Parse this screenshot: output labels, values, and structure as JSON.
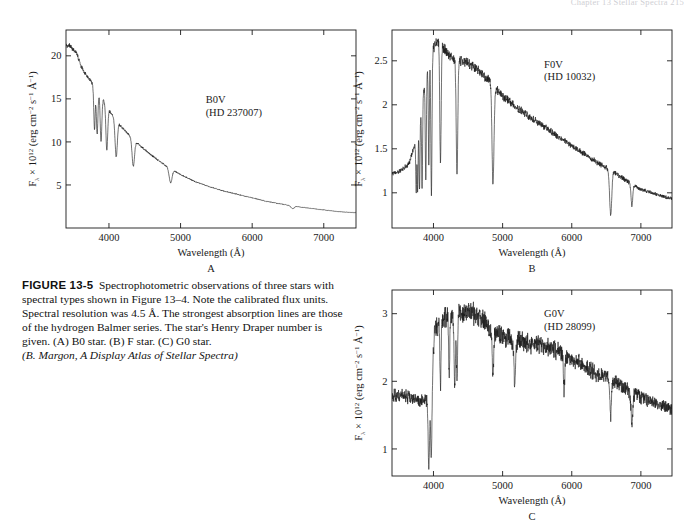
{
  "page": {
    "running_head": "Chapter 13  Stellar Spectra    215",
    "background": "#ffffff",
    "ink": "#1a1a1a"
  },
  "caption": {
    "figure_label": "FIGURE 13-5",
    "body": "Spectrophotometric observations of three stars with spectral types shown in Figure 13–4. Note the calibrated flux units. Spectral resolution was 4.5 Å. The strongest absorption lines are those of the hydrogen Balmer series. The star's Henry Draper number is given. (A) B0 star. (B) F star. (C) G0 star.",
    "credit": "(B. Margon, A Display Atlas of Stellar Spectra)"
  },
  "axis": {
    "xlabel": "Wavelength (Å)",
    "ylabel_prefix": "F",
    "ylabel_sub": "λ",
    "ylabel_mid": " × 10",
    "ylabel_exp": "12",
    "ylabel_units": " (erg cm",
    "ylabel_exp2": "−2",
    "ylabel_units2": " s",
    "ylabel_exp3": "−1",
    "ylabel_units3": " Å",
    "ylabel_exp4": "−1",
    "ylabel_close": ")"
  },
  "chart_data": [
    {
      "type": "line",
      "panel": "A",
      "panel_letter": "A",
      "title": "B0V",
      "subtitle": "(HD 237007)",
      "spectral_type": "B0V",
      "hd_number": "HD 237007",
      "xlabel": "Wavelength (Å)",
      "ylabel": "F_lambda x 10^12 (erg cm^-2 s^-1 A^-1)",
      "xlim": [
        3400,
        7450
      ],
      "ylim": [
        0,
        23
      ],
      "xticks": [
        4000,
        5000,
        6000,
        7000
      ],
      "yticks": [
        5,
        10,
        15,
        20
      ],
      "grid": false,
      "legend": "none",
      "annotation_xy": [
        5350,
        14.5
      ],
      "continuum_x": [
        3450,
        3550,
        3600,
        3650,
        3700,
        3750,
        3800,
        3850,
        3900,
        3950,
        4000,
        4100,
        4200,
        4300,
        4400,
        4500,
        4600,
        4700,
        4800,
        4900,
        5000,
        5200,
        5400,
        5600,
        5800,
        6000,
        6200,
        6400,
        6600,
        6800,
        7000,
        7200,
        7400
      ],
      "continuum_y": [
        21.2,
        20.3,
        19.0,
        18.2,
        17.6,
        17.0,
        16.4,
        15.8,
        15.1,
        14.4,
        13.7,
        12.5,
        11.5,
        10.6,
        9.8,
        9.1,
        8.4,
        7.8,
        7.2,
        6.7,
        6.2,
        5.4,
        4.8,
        4.3,
        3.9,
        3.5,
        3.1,
        2.8,
        2.5,
        2.3,
        2.1,
        1.9,
        1.8
      ],
      "absorption_lines": [
        {
          "wavelength": 3798,
          "depth": 0.3,
          "width": 14,
          "name": "H10"
        },
        {
          "wavelength": 3835,
          "depth": 0.32,
          "width": 15,
          "name": "H9"
        },
        {
          "wavelength": 3889,
          "depth": 0.34,
          "width": 16,
          "name": "H8"
        },
        {
          "wavelength": 3970,
          "depth": 0.36,
          "width": 18,
          "name": "H-epsilon"
        },
        {
          "wavelength": 4101,
          "depth": 0.34,
          "width": 22,
          "name": "H-delta"
        },
        {
          "wavelength": 4340,
          "depth": 0.3,
          "width": 24,
          "name": "H-gamma"
        },
        {
          "wavelength": 4861,
          "depth": 0.24,
          "width": 28,
          "name": "H-beta"
        },
        {
          "wavelength": 6563,
          "depth": 0.12,
          "width": 30,
          "name": "H-alpha"
        }
      ],
      "noise_level": 0.012
    },
    {
      "type": "line",
      "panel": "B",
      "panel_letter": "B",
      "title": "F0V",
      "subtitle": "(HD 10032)",
      "spectral_type": "F0V",
      "hd_number": "HD 10032",
      "xlabel": "Wavelength (Å)",
      "ylabel": "F_lambda x 10^12 (erg cm^-2 s^-1 A^-1)",
      "xlim": [
        3400,
        7450
      ],
      "ylim": [
        0.6,
        2.85
      ],
      "xticks": [
        4000,
        5000,
        6000,
        7000
      ],
      "yticks": [
        1,
        1.5,
        2,
        2.5
      ],
      "grid": false,
      "legend": "none",
      "annotation_xy": [
        5600,
        2.42
      ],
      "continuum_x": [
        3450,
        3550,
        3650,
        3750,
        3820,
        3900,
        3980,
        4050,
        4120,
        4200,
        4300,
        4400,
        4500,
        4600,
        4700,
        4800,
        4900,
        5000,
        5200,
        5400,
        5600,
        5800,
        6000,
        6200,
        6400,
        6600,
        6800,
        7000,
        7200,
        7400
      ],
      "continuum_y": [
        1.22,
        1.26,
        1.34,
        1.6,
        1.95,
        2.35,
        2.62,
        2.72,
        2.68,
        2.58,
        2.52,
        2.5,
        2.47,
        2.42,
        2.35,
        2.28,
        2.18,
        2.1,
        1.97,
        1.86,
        1.75,
        1.64,
        1.53,
        1.43,
        1.33,
        1.24,
        1.13,
        1.04,
        0.99,
        0.94
      ],
      "absorption_lines": [
        {
          "wavelength": 3750,
          "depth": 0.38,
          "width": 9,
          "name": "H12"
        },
        {
          "wavelength": 3771,
          "depth": 0.4,
          "width": 9,
          "name": "H11"
        },
        {
          "wavelength": 3798,
          "depth": 0.44,
          "width": 10,
          "name": "H10"
        },
        {
          "wavelength": 3835,
          "depth": 0.48,
          "width": 10,
          "name": "H9"
        },
        {
          "wavelength": 3889,
          "depth": 0.5,
          "width": 11,
          "name": "H8"
        },
        {
          "wavelength": 3933,
          "depth": 0.46,
          "width": 10,
          "name": "Ca II K"
        },
        {
          "wavelength": 3970,
          "depth": 0.62,
          "width": 12,
          "name": "H-epsilon + Ca H"
        },
        {
          "wavelength": 4101,
          "depth": 0.5,
          "width": 14,
          "name": "H-delta"
        },
        {
          "wavelength": 4340,
          "depth": 0.52,
          "width": 16,
          "name": "H-gamma"
        },
        {
          "wavelength": 4861,
          "depth": 0.5,
          "width": 20,
          "name": "H-beta"
        },
        {
          "wavelength": 6563,
          "depth": 0.4,
          "width": 22,
          "name": "H-alpha"
        },
        {
          "wavelength": 6870,
          "depth": 0.22,
          "width": 18,
          "name": "O2 B-band"
        }
      ],
      "noise_level": 0.022
    },
    {
      "type": "line",
      "panel": "C",
      "panel_letter": "C",
      "title": "G0V",
      "subtitle": "(HD 28099)",
      "spectral_type": "G0V",
      "hd_number": "HD 28099",
      "xlabel": "Wavelength (Å)",
      "ylabel": "F_lambda x 10^12 (erg cm^-2 s^-1 A^-1)",
      "xlim": [
        3400,
        7450
      ],
      "ylim": [
        0.6,
        3.35
      ],
      "xticks": [
        4000,
        5000,
        6000,
        7000
      ],
      "yticks": [
        1,
        2,
        3
      ],
      "grid": false,
      "legend": "none",
      "annotation_xy": [
        5600,
        2.95
      ],
      "continuum_x": [
        3450,
        3550,
        3650,
        3750,
        3850,
        3950,
        4020,
        4100,
        4200,
        4300,
        4400,
        4500,
        4600,
        4700,
        4800,
        4900,
        5000,
        5200,
        5400,
        5600,
        5800,
        6000,
        6200,
        6400,
        6600,
        6800,
        7000,
        7200,
        7400
      ],
      "continuum_y": [
        1.78,
        1.8,
        1.76,
        1.72,
        1.7,
        1.74,
        2.72,
        2.92,
        2.95,
        2.96,
        3.02,
        3.06,
        3.0,
        2.92,
        2.8,
        2.72,
        2.66,
        2.6,
        2.56,
        2.52,
        2.46,
        2.32,
        2.2,
        2.1,
        2.02,
        1.88,
        1.76,
        1.68,
        1.6
      ],
      "absorption_lines": [
        {
          "wavelength": 3933,
          "depth": 0.58,
          "width": 14,
          "name": "Ca II K"
        },
        {
          "wavelength": 3968,
          "depth": 0.56,
          "width": 14,
          "name": "Ca II H"
        },
        {
          "wavelength": 4101,
          "depth": 0.34,
          "width": 12,
          "name": "H-delta"
        },
        {
          "wavelength": 4227,
          "depth": 0.3,
          "width": 11,
          "name": "Ca I"
        },
        {
          "wavelength": 4308,
          "depth": 0.36,
          "width": 14,
          "name": "G-band CH"
        },
        {
          "wavelength": 4340,
          "depth": 0.32,
          "width": 12,
          "name": "H-gamma"
        },
        {
          "wavelength": 4861,
          "depth": 0.26,
          "width": 14,
          "name": "H-beta"
        },
        {
          "wavelength": 5175,
          "depth": 0.24,
          "width": 16,
          "name": "Mg I b"
        },
        {
          "wavelength": 5890,
          "depth": 0.22,
          "width": 14,
          "name": "Na I D"
        },
        {
          "wavelength": 6563,
          "depth": 0.28,
          "width": 16,
          "name": "H-alpha"
        },
        {
          "wavelength": 6870,
          "depth": 0.26,
          "width": 18,
          "name": "O2 B-band"
        }
      ],
      "noise_level": 0.055
    }
  ]
}
